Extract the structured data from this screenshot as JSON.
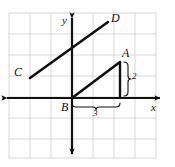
{
  "figure": {
    "kind": "coordinate-plane-diagram",
    "background_color": "#fefefe",
    "ink_color": "#111111",
    "grid_color": "#c9c9c9",
    "grid": {
      "visible": true,
      "cell_size_px": 21,
      "left_px": 9,
      "top_px": 13,
      "columns": 7,
      "rows": 7
    },
    "axes": {
      "x_label": "x",
      "y_label": "y",
      "origin_px": {
        "x": 72,
        "y": 98
      },
      "x_axis_arrows": "both",
      "y_axis_arrows": "both"
    },
    "points": [
      {
        "name": "C",
        "label": "C",
        "x_px": 16,
        "y_px": 73
      },
      {
        "name": "D",
        "label": "D",
        "x_px": 113,
        "y_px": 18
      },
      {
        "name": "A",
        "label": "A",
        "x_px": 124,
        "y_px": 53
      },
      {
        "name": "B",
        "label": "B",
        "x_px": 64,
        "y_px": 107
      }
    ],
    "line_cd": {
      "name": "line-CD",
      "from_px": {
        "x": 30,
        "y": 78
      },
      "to_px": {
        "x": 108,
        "y": 22
      }
    },
    "triangle": {
      "name": "right-triangle-ABx",
      "vertices_px": [
        {
          "x": 72,
          "y": 98
        },
        {
          "x": 120,
          "y": 62
        },
        {
          "x": 120,
          "y": 98
        }
      ]
    },
    "measures": [
      {
        "name": "vertical-leg",
        "label": "2",
        "orientation": "vertical",
        "label_x_px": 133,
        "label_y_px": 76
      },
      {
        "name": "horizontal-leg",
        "label": "3",
        "orientation": "horizontal",
        "label_x_px": 95,
        "label_y_px": 114
      }
    ]
  }
}
